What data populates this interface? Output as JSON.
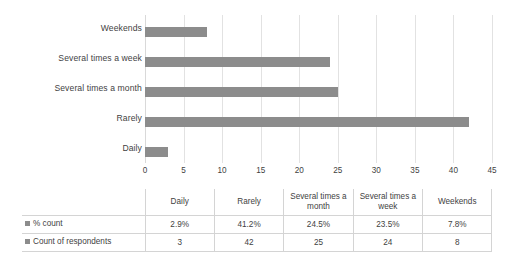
{
  "chart_data": {
    "type": "bar",
    "orientation": "horizontal",
    "title": "",
    "xlabel": "",
    "ylabel": "",
    "categories": [
      "Daily",
      "Rarely",
      "Several times a month",
      "Several times a week",
      "Weekends"
    ],
    "display_order_top_to_bottom": [
      "Weekends",
      "Several times a week",
      "Several times a month",
      "Rarely",
      "Daily"
    ],
    "series": [
      {
        "name": "Count of respondents",
        "values": [
          3,
          42,
          25,
          24,
          8
        ],
        "plotted": true,
        "color": "#8c8c8c"
      },
      {
        "name": "% count",
        "values": [
          "2.9%",
          "41.2%",
          "24.5%",
          "23.5%",
          "7.8%"
        ],
        "plotted": false,
        "color": "#8c8c8c"
      }
    ],
    "xlim": [
      0,
      45
    ],
    "xticks": [
      0,
      5,
      10,
      15,
      20,
      25,
      30,
      35,
      40,
      45
    ],
    "grid": true,
    "legend_position": "data-table-row-headers",
    "bar_color": "#8c8c8c",
    "gridline_color": "#e2e2e2"
  },
  "axis": {
    "tick_labels": [
      "0",
      "5",
      "10",
      "15",
      "20",
      "25",
      "30",
      "35",
      "40",
      "45"
    ]
  },
  "category_labels": {
    "weekends": "Weekends",
    "several_times_a_week": "Several times a week",
    "several_times_a_month": "Several times a month",
    "rarely": "Rarely",
    "daily": "Daily"
  },
  "table": {
    "corner_label": "",
    "column_headers": [
      "Daily",
      "Rarely",
      "Several times a month",
      "Several times a week",
      "Weekends"
    ],
    "rows": [
      {
        "series_label": "% count",
        "values": [
          "2.9%",
          "41.2%",
          "24.5%",
          "23.5%",
          "7.8%"
        ]
      },
      {
        "series_label": "Count of respondents",
        "values": [
          "3",
          "42",
          "25",
          "24",
          "8"
        ]
      }
    ]
  }
}
